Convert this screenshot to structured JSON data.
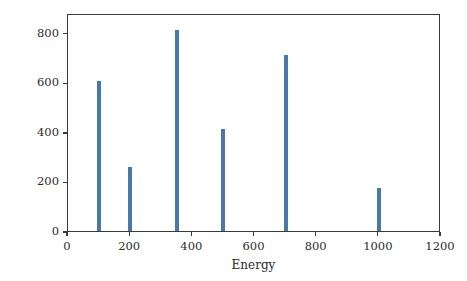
{
  "chart_data": {
    "type": "bar",
    "title": "",
    "subtitle": "",
    "xlabel": "Energy",
    "ylabel": "Counts",
    "x": [
      100,
      200,
      350,
      500,
      700,
      1000
    ],
    "values": [
      607,
      260,
      812,
      410,
      712,
      175
    ],
    "categories": [
      "100",
      "200",
      "350",
      "500",
      "700",
      "1000"
    ],
    "bar_width": 13,
    "xlim": [
      0,
      1200
    ],
    "ylim": [
      0,
      880
    ],
    "xticks": [
      0,
      200,
      400,
      600,
      800,
      1000,
      1200
    ],
    "xticklabels": [
      "0",
      "200",
      "400",
      "600",
      "800",
      "1000",
      "1200"
    ],
    "yticks": [
      0,
      200,
      400,
      600,
      800
    ],
    "yticklabels": [
      "0",
      "200",
      "400",
      "600",
      "800"
    ],
    "grid": false,
    "legend": null,
    "legend_position": "none",
    "annotations": [],
    "colors": {
      "bar": "#4878A8",
      "axis": "#3a3a3a",
      "text": "#2b2b2b",
      "background": "#ffffff"
    }
  }
}
